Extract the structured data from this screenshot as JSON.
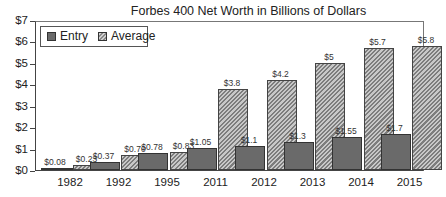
{
  "chart_data": {
    "type": "bar",
    "title": "Forbes 400 Net Worth in Billions of Dollars",
    "xlabel": "",
    "ylabel": "",
    "ylim": [
      0,
      7
    ],
    "yticks": [
      "$0",
      "$1",
      "$2",
      "$3",
      "$4",
      "$5",
      "$6",
      "$7"
    ],
    "categories": [
      "1982",
      "1992",
      "1995",
      "2011",
      "2012",
      "2013",
      "2014",
      "2015"
    ],
    "series": [
      {
        "name": "Entry",
        "values": [
          0.08,
          0.37,
          0.78,
          1.05,
          1.1,
          1.3,
          1.55,
          1.7
        ],
        "labels": [
          "$0.08",
          "$0.37",
          "$0.78",
          "$1.05",
          "$1.1",
          "$1.3",
          "$1.55",
          "$1.7"
        ],
        "color": "#6a6a6a"
      },
      {
        "name": "Average",
        "values": [
          0.23,
          0.7,
          0.83,
          3.8,
          4.2,
          5,
          5.7,
          5.8
        ],
        "labels": [
          "$0.23",
          "$0.70",
          "$0.83",
          "$3.8",
          "$4.2",
          "$5",
          "$5.7",
          "$5.8"
        ],
        "color": "#a0a0a0",
        "pattern": "diagonal-hatch"
      }
    ],
    "grid": false,
    "legend_position": "top-left"
  },
  "legend": {
    "entry": "Entry",
    "average": "Average"
  }
}
